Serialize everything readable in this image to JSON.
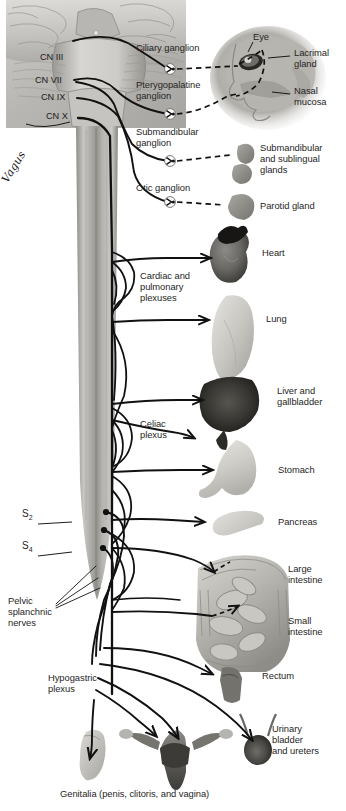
{
  "figure": {
    "caption": "Genitalia (penis, clitoris, and vagina)",
    "background_color": "#ffffff",
    "line_color": "#111111",
    "text_color": "#262626"
  },
  "cranial_nerves": [
    {
      "id": "cn3",
      "label": "CN III",
      "x": 40,
      "y": 57
    },
    {
      "id": "cn7",
      "label": "CN VII",
      "x": 35,
      "y": 80
    },
    {
      "id": "cn9",
      "label": "CN IX",
      "x": 41,
      "y": 97
    },
    {
      "id": "cn10",
      "label": "CN X",
      "x": 46,
      "y": 116
    }
  ],
  "nerve_trunk": {
    "label": "Vagus",
    "x": 14,
    "y": 160
  },
  "spinal_segments": [
    {
      "label": "S",
      "subscript": "2",
      "x": 22,
      "y": 514
    },
    {
      "label": "S",
      "subscript": "4",
      "x": 22,
      "y": 546
    }
  ],
  "ganglia": [
    {
      "id": "ciliary",
      "label": "Ciliary ganglion",
      "x": 136,
      "y": 48,
      "node_x": 172,
      "node_y": 69
    },
    {
      "id": "pterygopalatine",
      "label": "Pterygopalatine\nganglion",
      "x": 136,
      "y": 84,
      "node_x": 172,
      "node_y": 114
    },
    {
      "id": "submandibular",
      "label": "Submandibular\nganglion",
      "x": 136,
      "y": 131,
      "node_x": 172,
      "node_y": 161
    },
    {
      "id": "otic",
      "label": "Otic ganglion",
      "x": 136,
      "y": 186,
      "node_x": 172,
      "node_y": 202
    }
  ],
  "plexuses": [
    {
      "id": "cardiopulmonary",
      "label": "Cardiac and\npulmonary\nplexuses",
      "x": 140,
      "y": 275
    },
    {
      "id": "celiac",
      "label": "Celiac\nplexus",
      "x": 140,
      "y": 423
    },
    {
      "id": "pelvic_splanchnic",
      "label": "Pelvic\nsplanchnic\nnerves",
      "x": 22,
      "y": 600
    },
    {
      "id": "hypogastric",
      "label": "Hypogastric\nplexus",
      "x": 48,
      "y": 680
    }
  ],
  "targets": [
    {
      "id": "eye",
      "label": "Eye",
      "x": 253,
      "y": 37
    },
    {
      "id": "lacrimal",
      "label": "Lacrimal\ngland",
      "x": 294,
      "y": 52
    },
    {
      "id": "nasal_mucosa",
      "label": "Nasal\nmucosa",
      "x": 294,
      "y": 90
    },
    {
      "id": "salivary",
      "label": "Submandibular\nand sublingual\nglands",
      "x": 260,
      "y": 147
    },
    {
      "id": "parotid",
      "label": "Parotid gland",
      "x": 260,
      "y": 205
    },
    {
      "id": "heart",
      "label": "Heart",
      "x": 260,
      "y": 252
    },
    {
      "id": "lung",
      "label": "Lung",
      "x": 266,
      "y": 318
    },
    {
      "id": "liver",
      "label": "Liver and\ngallbladder",
      "x": 277,
      "y": 390
    },
    {
      "id": "stomach",
      "label": "Stomach",
      "x": 278,
      "y": 469
    },
    {
      "id": "pancreas",
      "label": "Pancreas",
      "x": 278,
      "y": 521
    },
    {
      "id": "large_intestine",
      "label": "Large\nintestine",
      "x": 288,
      "y": 568
    },
    {
      "id": "small_intestine",
      "label": "Small\nintestine",
      "x": 288,
      "y": 620
    },
    {
      "id": "rectum",
      "label": "Rectum",
      "x": 262,
      "y": 675
    },
    {
      "id": "bladder",
      "label": "Urinary\nbladder\nand ureters",
      "x": 272,
      "y": 728
    }
  ]
}
